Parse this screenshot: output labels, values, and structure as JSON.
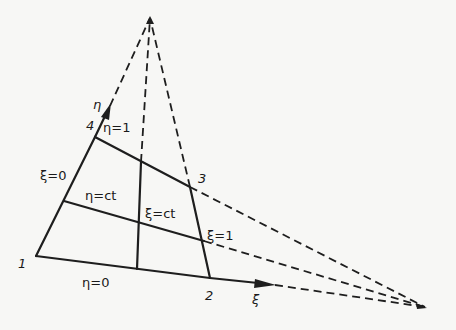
{
  "diagram": {
    "background": "#f7f7f5",
    "line_color": "#1e1e1e",
    "nodes": [
      {
        "id": "1",
        "label": "1",
        "x": 36,
        "y": 256
      },
      {
        "id": "2",
        "label": "2",
        "x": 210,
        "y": 278
      },
      {
        "id": "3",
        "label": "3",
        "x": 190,
        "y": 187
      },
      {
        "id": "4",
        "label": "4",
        "x": 95,
        "y": 137
      }
    ],
    "vanishing_points": [
      {
        "id": "top",
        "x": 150,
        "y": 18
      },
      {
        "id": "right",
        "x": 425,
        "y": 307
      }
    ],
    "axes": [
      {
        "id": "xi-axis",
        "label": "ξ"
      },
      {
        "id": "eta-axis",
        "label": "η"
      }
    ],
    "edge_labels": {
      "xi_0": "ξ=0",
      "xi_1": "ξ=1",
      "eta_0": "η=0",
      "eta_1": "η=1",
      "xi_ct": "ξ=ct",
      "eta_ct": "η=ct"
    }
  }
}
